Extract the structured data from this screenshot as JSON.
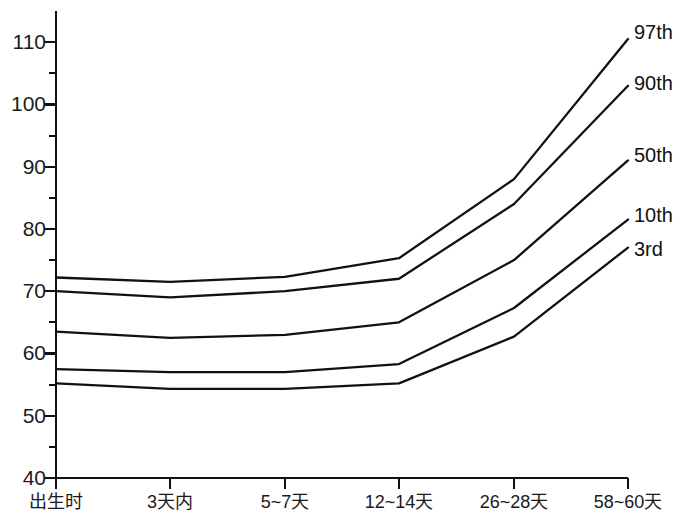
{
  "chart_data": {
    "type": "line",
    "title": "",
    "subtitle": "",
    "xlabel": "",
    "ylabel": "",
    "categories": [
      "出生时",
      "3天内",
      "5~7天",
      "12~14天",
      "26~28天",
      "58~60天"
    ],
    "ylim": [
      40,
      115
    ],
    "ytick_labels": [
      "110",
      "100",
      "90",
      "80",
      "70",
      "60",
      "50",
      "40"
    ],
    "ytick_values": [
      110,
      100,
      90,
      80,
      70,
      60,
      50,
      40
    ],
    "yminor_values": [
      105,
      95,
      85,
      75,
      65,
      55,
      45
    ],
    "grid": false,
    "legend_position": "right-of-line-ends",
    "line_color": "#111111",
    "axis_color": "#111111",
    "series": [
      {
        "name": "97th",
        "values": [
          72.2,
          71.5,
          72.3,
          75.3,
          88.0,
          110.5
        ]
      },
      {
        "name": "90th",
        "values": [
          70.0,
          69.0,
          70.0,
          72.0,
          84.0,
          103.0
        ]
      },
      {
        "name": "50th",
        "values": [
          63.5,
          62.5,
          63.0,
          65.0,
          75.0,
          91.0
        ]
      },
      {
        "name": "10th",
        "values": [
          57.5,
          57.0,
          57.0,
          58.3,
          67.3,
          81.5
        ]
      },
      {
        "name": "3rd",
        "values": [
          55.2,
          54.3,
          54.3,
          55.2,
          62.7,
          77.0
        ]
      }
    ],
    "axes_geometry": {
      "x_positions": [
        56,
        170,
        285,
        399,
        514,
        628
      ],
      "y_value_top": 115,
      "y_value_bottom": 40,
      "y_pixel_top": 11,
      "y_pixel_bottom": 478
    }
  }
}
